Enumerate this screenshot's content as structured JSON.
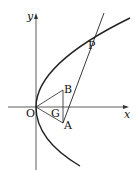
{
  "diagram": {
    "type": "geometry-figure",
    "axes": {
      "x_label": "x",
      "y_label": "y",
      "origin_label": "O"
    },
    "points": {
      "O": "O",
      "A": "A",
      "B": "B",
      "G": "G",
      "P": "P"
    },
    "colors": {
      "stroke": "#222222",
      "background": "#ffffff"
    }
  }
}
